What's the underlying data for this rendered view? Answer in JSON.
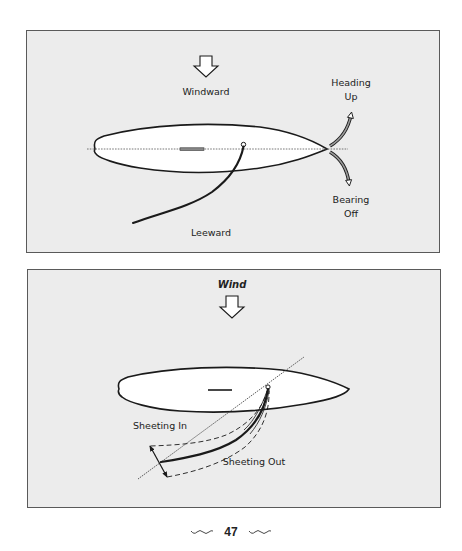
{
  "panels": {
    "top": {
      "wind_label": "Windward",
      "lee_label": "Leeward",
      "heading_up": {
        "line1": "Heading",
        "line2": "Up"
      },
      "bearing_off": {
        "line1": "Bearing",
        "line2": "Off"
      },
      "icons": {
        "wind_arrow": "down-arrow-icon",
        "heading_up_arrow": "curved-arrow-up-icon",
        "bearing_off_arrow": "curved-arrow-down-icon"
      }
    },
    "bottom": {
      "wind_label": "Wind",
      "sheeting_in": "Sheeting In",
      "sheeting_out": "Sheeting Out",
      "icons": {
        "wind_arrow": "down-arrow-icon"
      }
    }
  },
  "footer": {
    "page_number": "47",
    "ornament": "wave-ornament"
  },
  "colors": {
    "panel_bg": "#ececec",
    "panel_border": "#5a5a5a",
    "hull_fill": "#ffffff",
    "line": "#1a1a1a"
  }
}
